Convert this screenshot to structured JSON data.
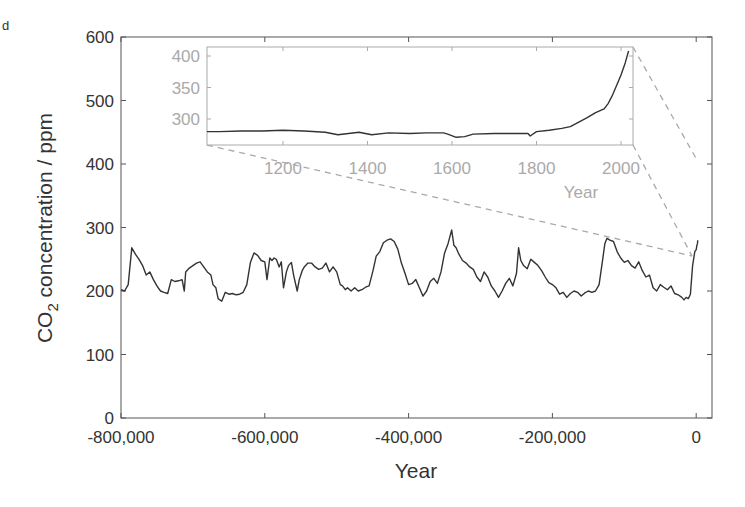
{
  "cropped_text": "d",
  "chart_data": [
    {
      "type": "line",
      "title": "",
      "xlabel": "Year",
      "ylabel": "CO2 concentration / ppm",
      "ylabel_parts": {
        "pre": "CO",
        "sub": "2",
        "post": " concentration / ppm"
      },
      "xlim": [
        -805000,
        22000
      ],
      "ylim": [
        0,
        600
      ],
      "xticks": [
        -800000,
        -600000,
        -400000,
        -200000,
        0
      ],
      "xtick_labels": [
        "-800,000",
        "-600,000",
        "-400,000",
        "-200,000",
        "0"
      ],
      "yticks": [
        0,
        100,
        200,
        300,
        400,
        500,
        600
      ],
      "ytick_labels": [
        "0",
        "100",
        "200",
        "300",
        "400",
        "500",
        "600"
      ],
      "grid": false,
      "series": [
        {
          "name": "CO2 (ice core + instrumental)",
          "color": "#333333",
          "x": [
            -800000,
            -795000,
            -790000,
            -785000,
            -780000,
            -775000,
            -770000,
            -765000,
            -760000,
            -755000,
            -750000,
            -745000,
            -740000,
            -735000,
            -730000,
            -725000,
            -720000,
            -715000,
            -712000,
            -710000,
            -705000,
            -700000,
            -695000,
            -690000,
            -685000,
            -680000,
            -675000,
            -672000,
            -668000,
            -665000,
            -660000,
            -655000,
            -650000,
            -645000,
            -640000,
            -635000,
            -630000,
            -625000,
            -620000,
            -615000,
            -610000,
            -605000,
            -600000,
            -597000,
            -593000,
            -590000,
            -587000,
            -584000,
            -580000,
            -577000,
            -574000,
            -570000,
            -567000,
            -563000,
            -560000,
            -555000,
            -552000,
            -548000,
            -545000,
            -540000,
            -535000,
            -530000,
            -525000,
            -520000,
            -515000,
            -510000,
            -505000,
            -500000,
            -495000,
            -492000,
            -488000,
            -485000,
            -480000,
            -475000,
            -470000,
            -465000,
            -460000,
            -455000,
            -450000,
            -445000,
            -440000,
            -435000,
            -430000,
            -425000,
            -420000,
            -415000,
            -410000,
            -405000,
            -400000,
            -395000,
            -390000,
            -385000,
            -380000,
            -375000,
            -370000,
            -365000,
            -360000,
            -355000,
            -350000,
            -345000,
            -340000,
            -337000,
            -334000,
            -330000,
            -325000,
            -320000,
            -315000,
            -310000,
            -305000,
            -300000,
            -295000,
            -290000,
            -285000,
            -280000,
            -275000,
            -270000,
            -265000,
            -260000,
            -255000,
            -250000,
            -247000,
            -244000,
            -240000,
            -235000,
            -230000,
            -225000,
            -220000,
            -215000,
            -210000,
            -205000,
            -200000,
            -195000,
            -190000,
            -185000,
            -180000,
            -175000,
            -170000,
            -165000,
            -160000,
            -155000,
            -150000,
            -145000,
            -140000,
            -135000,
            -130000,
            -127000,
            -124000,
            -120000,
            -115000,
            -110000,
            -105000,
            -100000,
            -95000,
            -90000,
            -85000,
            -80000,
            -75000,
            -70000,
            -65000,
            -60000,
            -55000,
            -50000,
            -45000,
            -40000,
            -35000,
            -30000,
            -25000,
            -20000,
            -17000,
            -14000,
            -11000,
            -8000,
            -5000,
            -2000,
            0,
            1000,
            1800,
            2018
          ],
          "y": [
            202,
            200,
            210,
            268,
            258,
            250,
            240,
            225,
            230,
            218,
            208,
            200,
            198,
            196,
            218,
            215,
            216,
            218,
            200,
            230,
            236,
            240,
            244,
            246,
            238,
            230,
            225,
            210,
            205,
            188,
            184,
            198,
            195,
            196,
            194,
            195,
            198,
            210,
            245,
            260,
            256,
            248,
            246,
            218,
            252,
            248,
            252,
            250,
            238,
            246,
            205,
            230,
            240,
            245,
            225,
            200,
            218,
            232,
            238,
            244,
            244,
            238,
            234,
            236,
            244,
            230,
            238,
            230,
            210,
            208,
            202,
            205,
            200,
            205,
            200,
            202,
            206,
            208,
            230,
            255,
            262,
            276,
            280,
            282,
            278,
            266,
            244,
            228,
            210,
            212,
            218,
            205,
            192,
            200,
            215,
            220,
            212,
            230,
            260,
            275,
            296,
            272,
            268,
            258,
            248,
            244,
            238,
            234,
            222,
            215,
            230,
            222,
            208,
            200,
            190,
            200,
            212,
            220,
            208,
            228,
            268,
            248,
            240,
            235,
            250,
            245,
            240,
            232,
            222,
            213,
            210,
            205,
            195,
            198,
            190,
            196,
            200,
            198,
            192,
            197,
            200,
            198,
            200,
            210,
            250,
            275,
            283,
            280,
            278,
            262,
            252,
            245,
            248,
            240,
            236,
            246,
            232,
            222,
            225,
            205,
            200,
            210,
            206,
            202,
            208,
            196,
            194,
            190,
            186,
            190,
            188,
            195,
            240,
            262,
            265,
            272,
            275,
            280,
            285,
            412
          ]
        }
      ]
    },
    {
      "type": "line",
      "title": "inset (zoom of last ~1000 years)",
      "xlabel": "Year",
      "ylabel": "",
      "xlim": [
        1020,
        2028
      ],
      "ylim": [
        259,
        415
      ],
      "xticks": [
        1200,
        1400,
        1600,
        1800,
        2000
      ],
      "xtick_labels": [
        "1200",
        "1400",
        "1600",
        "1800",
        "2000"
      ],
      "yticks": [
        300,
        350,
        400
      ],
      "ytick_labels": [
        "300",
        "350",
        "400"
      ],
      "grid": false,
      "series": [
        {
          "name": "CO2 last millennium",
          "color": "#333333",
          "x": [
            1020,
            1050,
            1100,
            1150,
            1200,
            1250,
            1300,
            1330,
            1380,
            1410,
            1450,
            1500,
            1540,
            1580,
            1590,
            1610,
            1630,
            1650,
            1700,
            1750,
            1780,
            1785,
            1800,
            1830,
            1860,
            1880,
            1900,
            1920,
            1940,
            1960,
            1970,
            1980,
            1990,
            2000,
            2010,
            2018
          ],
          "y": [
            280,
            280,
            281,
            281,
            282,
            281,
            279,
            275,
            279,
            275,
            278,
            277,
            278,
            278,
            276,
            271,
            272,
            276,
            277,
            277,
            277,
            273,
            280,
            282,
            285,
            288,
            295,
            302,
            310,
            316,
            325,
            338,
            354,
            370,
            389,
            408
          ]
        }
      ]
    }
  ],
  "main_axes": {
    "x_label": "Year",
    "y_label_pre": "CO",
    "y_label_sub": "2",
    "y_label_post": " concentration / ppm",
    "x_tick_labels": [
      "-800,000",
      "-600,000",
      "-400,000",
      "-200,000",
      "0"
    ],
    "y_tick_labels": [
      "0",
      "100",
      "200",
      "300",
      "400",
      "500",
      "600"
    ]
  },
  "inset_axes": {
    "x_label": "Year",
    "x_tick_labels": [
      "1200",
      "1400",
      "1600",
      "1800",
      "2000"
    ],
    "y_tick_labels": [
      "300",
      "350",
      "400"
    ]
  },
  "colors": {
    "line": "#333333",
    "axis": "#555555",
    "inset_axis": "#aaaaaa",
    "connector": "#aaaaaa",
    "text": "#333333",
    "inset_text": "#aaaaaa"
  }
}
